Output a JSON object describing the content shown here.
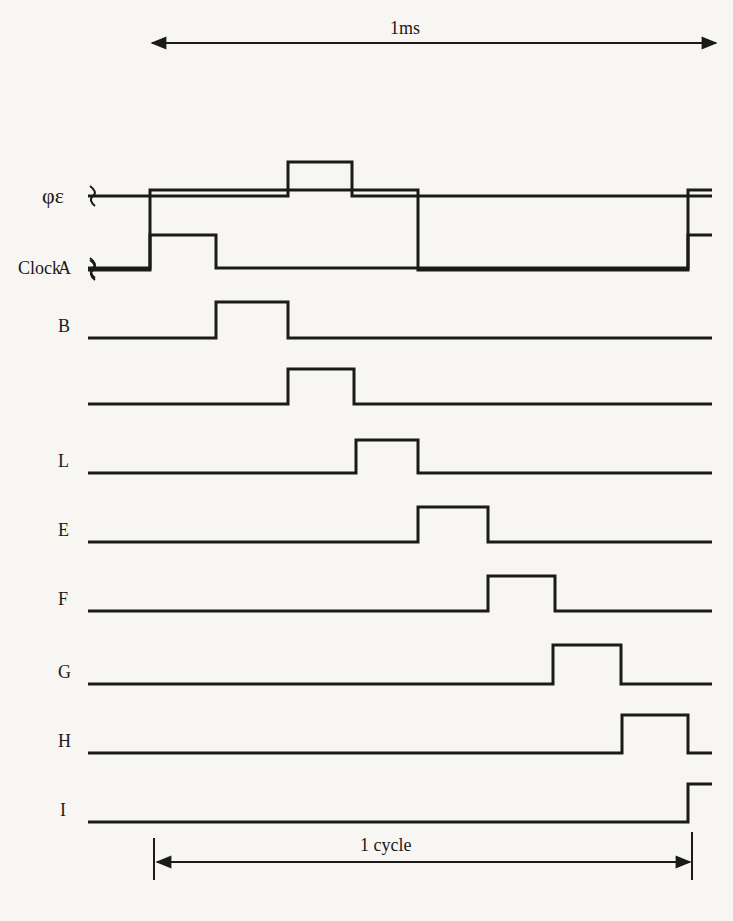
{
  "top_dimension": {
    "label": "1ms",
    "x1": 152,
    "x2": 716,
    "y": 43,
    "text_x": 390,
    "text_y": 18
  },
  "bottom_dimension": {
    "label": "1 cycle",
    "x1": 157,
    "x2": 690,
    "y": 862,
    "tick_top": 838,
    "tick_bottom": 880,
    "text_x": 390,
    "text_y": 835
  },
  "signals": [
    {
      "name": "clock",
      "label": "Clock",
      "label_x": 18,
      "y_low": 270,
      "y_high": 190,
      "x_start": 88,
      "x_end": 712,
      "break_mark": true,
      "edges": [
        150,
        418,
        688
      ],
      "start_level": 0,
      "label_y": 258
    },
    {
      "name": "phi-e",
      "label": "φε",
      "label_x": 42,
      "y_low": 342,
      "y_high": 162,
      "x_start": 88,
      "x_end": 712,
      "break_mark": true,
      "edges": [
        288,
        352
      ],
      "start_level": 0,
      "label_y": 330
    },
    {
      "name": "a",
      "label": "A",
      "label_x": 58,
      "y_low": 268,
      "y_high": 235,
      "x_start": 88,
      "x_end": 712,
      "break_mark": true,
      "edges": [
        150,
        216,
        688
      ],
      "start_level": 0,
      "label_y": 256
    },
    {
      "name": "b",
      "label": "B",
      "label_x": 58,
      "y_low": 338,
      "y_high": 302,
      "x_start": 88,
      "x_end": 712,
      "break_mark": false,
      "edges": [
        216,
        288
      ],
      "start_level": 0,
      "label_y": 326
    },
    {
      "name": "unlabeled",
      "label": "",
      "label_x": 58,
      "y_low": 404,
      "y_high": 369,
      "x_start": 88,
      "x_end": 712,
      "break_mark": false,
      "edges": [
        288,
        354
      ],
      "start_level": 0,
      "label_y": 392
    },
    {
      "name": "l",
      "label": "L",
      "label_x": 58,
      "y_low": 473,
      "y_high": 440,
      "x_start": 88,
      "x_end": 712,
      "break_mark": false,
      "edges": [
        356,
        418
      ],
      "start_level": 0,
      "label_y": 461
    },
    {
      "name": "e",
      "label": "E",
      "label_x": 58,
      "y_low": 542,
      "y_high": 507,
      "x_start": 88,
      "x_end": 712,
      "break_mark": false,
      "edges": [
        418,
        488
      ],
      "start_level": 0,
      "label_y": 530
    },
    {
      "name": "f",
      "label": "F",
      "label_x": 58,
      "y_low": 611,
      "y_high": 576,
      "x_start": 88,
      "x_end": 712,
      "break_mark": false,
      "edges": [
        488,
        555
      ],
      "start_level": 0,
      "label_y": 599
    },
    {
      "name": "g",
      "label": "G",
      "label_x": 58,
      "y_low": 684,
      "y_high": 645,
      "x_start": 88,
      "x_end": 712,
      "break_mark": false,
      "edges": [
        553,
        621
      ],
      "start_level": 0,
      "label_y": 672
    },
    {
      "name": "h",
      "label": "H",
      "label_x": 58,
      "y_low": 753,
      "y_high": 715,
      "x_start": 88,
      "x_end": 712,
      "break_mark": false,
      "edges": [
        622,
        688
      ],
      "start_level": 0,
      "label_y": 741
    },
    {
      "name": "i",
      "label": "I",
      "label_x": 60,
      "y_low": 822,
      "y_high": 784,
      "x_start": 88,
      "x_end": 712,
      "break_mark": false,
      "edges": [
        688
      ],
      "start_level": 0,
      "label_y": 810
    }
  ],
  "colors": {
    "ink": "#1a1a1a",
    "paper": "#f7f6f3"
  }
}
